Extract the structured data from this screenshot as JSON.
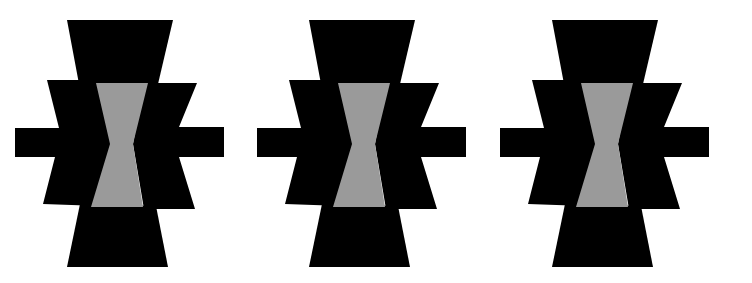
{
  "canvas": {
    "width": 752,
    "height": 283,
    "background": "#ffffff"
  },
  "colors": {
    "shape": "#000000",
    "hourglass": "#9a9a9a"
  },
  "figures": [
    {
      "name": "figure-1",
      "offset_x": 0,
      "offset_y": 0
    },
    {
      "name": "figure-2",
      "offset_x": 242,
      "offset_y": 0
    },
    {
      "name": "figure-3",
      "offset_x": 485,
      "offset_y": 0
    }
  ],
  "figure_shape": {
    "top_trapezoid": "67,20 173,20 158,84 79,84",
    "left_wing": "47,80 100,80 112,144 100,206 43,204 55,157 59,128",
    "right_wing": "144,83 197,83 179,127 179,157 195,209 144,209 133,144",
    "left_arm": "15,128 100,128 100,157 15,157",
    "right_arm": "150,127 224,127 224,157 150,157",
    "bottom_trapezoid": "80,204 156,206 168,267 67,267",
    "hourglass": "96,83 148,83 133,144 143,207 91,207 110,144"
  }
}
